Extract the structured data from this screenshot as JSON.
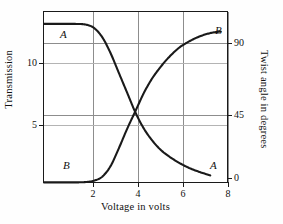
{
  "chart_data": {
    "type": "line",
    "title": "",
    "xlabel": "Voltage in volts",
    "ylabel": "Transmission",
    "ylabel_right": "Twist angle in degrees",
    "xlim": [
      0,
      8.9
    ],
    "xticks": [
      2,
      4,
      6,
      8
    ],
    "xticklabels": [
      "2",
      "4",
      "6",
      "8"
    ],
    "ylim_left": [
      0,
      13.0
    ],
    "yticks_left": [
      5,
      10
    ],
    "yticklabels_left": [
      "5",
      "10"
    ],
    "ylim_right": [
      0,
      106
    ],
    "yticks_right": [
      0,
      45,
      90
    ],
    "yticklabels_right": [
      "0",
      "45",
      "90"
    ],
    "grid": true,
    "legend": "inline-curve-labels",
    "series": [
      {
        "name": "A",
        "label": "A",
        "axis": "left",
        "description": "Transmission falls from maximum to near zero as voltage increases",
        "x": [
          0.0,
          0.5,
          1.0,
          1.5,
          2.0,
          2.4,
          2.8,
          3.2,
          3.6,
          4.0,
          4.4,
          4.8,
          5.2,
          5.6,
          6.0,
          6.5,
          7.0,
          7.5,
          8.0
        ],
        "y": [
          12.1,
          12.1,
          12.1,
          12.1,
          12.05,
          11.8,
          11.1,
          9.9,
          8.4,
          6.9,
          5.4,
          4.2,
          3.3,
          2.6,
          2.1,
          1.6,
          1.2,
          0.9,
          0.65
        ]
      },
      {
        "name": "B",
        "label": "B",
        "axis": "right",
        "description": "Twist angle rises from zero to about 90 degrees as voltage increases",
        "x": [
          0.0,
          0.5,
          1.0,
          1.5,
          2.0,
          2.4,
          2.8,
          3.2,
          3.6,
          4.0,
          4.4,
          4.8,
          5.2,
          5.6,
          6.0,
          6.5,
          7.0,
          7.5,
          8.0,
          8.5
        ],
        "y": [
          1.0,
          1.0,
          1.0,
          1.0,
          1.2,
          2.0,
          4.5,
          11.0,
          22.0,
          34.0,
          45.0,
          56.0,
          65.0,
          72.0,
          78.0,
          84.0,
          88.0,
          91.0,
          93.0,
          94.0
        ]
      }
    ],
    "annotations": [
      {
        "text": "A",
        "series": "A",
        "position": "upper-left"
      },
      {
        "text": "B",
        "series": "B",
        "position": "lower-left"
      },
      {
        "text": "B",
        "series": "B",
        "position": "upper-right"
      },
      {
        "text": "A",
        "series": "A",
        "position": "lower-right"
      }
    ],
    "crossing_point": {
      "voltage": 4.45,
      "transmission": 5.9,
      "twist_angle": 45
    }
  },
  "axes": {
    "x_tick_labels": [
      "2",
      "4",
      "6",
      "8"
    ],
    "y_left_tick_labels": [
      "10",
      "5"
    ],
    "y_right_tick_labels": [
      "90",
      "45",
      "0"
    ],
    "x_title": "Voltage in volts",
    "y_left_title": "Transmission",
    "y_right_title": "Twist angle in degrees"
  },
  "curve_labels": {
    "a_top": "A",
    "b_bottom": "B",
    "b_top": "B",
    "a_bottom": "A"
  },
  "colors": {
    "curve": "#1a1a1a",
    "frame": "#1a1a1a",
    "grid": "#8d8d8d",
    "grid_faint": "#b4b4b4",
    "background": "#ffffff"
  }
}
